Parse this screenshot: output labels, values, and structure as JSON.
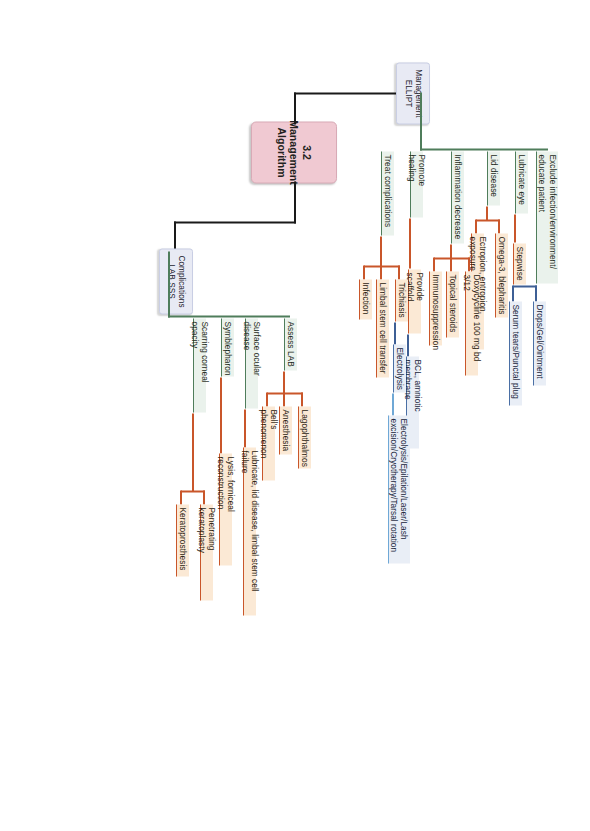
{
  "diagram": {
    "type": "mind-map",
    "orientation": "rotated-90-clockwise",
    "root": {
      "label": "3.2 Management\nAlgorithm",
      "color": "#f0c9d2"
    },
    "branches": [
      {
        "id": "management",
        "label": "Management\nELLIPT",
        "color": "#e8eaf4",
        "children": [
          {
            "label": "Exclude infection/environment/\neducate patient",
            "children": []
          },
          {
            "label": "Lubricate eye",
            "children": [
              {
                "label": "Stepwise",
                "children": [
                  {
                    "label": "Drops/Gel/Ointment"
                  },
                  {
                    "label": "Serum tears/Punctal plug"
                  }
                ]
              }
            ]
          },
          {
            "label": "Lid disease",
            "children": [
              {
                "label": "Omega-3, blepharitis",
                "children": []
              },
              {
                "label": "Ectropion, entropion, exposure",
                "children": []
              }
            ]
          },
          {
            "label": "Inflammation decrease",
            "children": [
              {
                "label": "Doxycycline 100 mg bd 3/12",
                "children": []
              },
              {
                "label": "Topical steroids",
                "children": []
              },
              {
                "label": "Immunosuppression",
                "children": []
              }
            ]
          },
          {
            "label": "Promote healing",
            "children": [
              {
                "label": "Provide scaffold",
                "children": [
                  {
                    "label": "BCL, amniotic membrane"
                  }
                ]
              }
            ]
          },
          {
            "label": "Treat complications",
            "children": [
              {
                "label": "Trichiasis",
                "children": [
                  {
                    "label": "Electrolysis"
                  },
                  {
                    "label": "Electrolysis/Epilation/Laser/Lash\nexcision/Cryotherapy/Tarsal rotation"
                  }
                ]
              },
              {
                "label": "Limbal stem cell transfer",
                "children": []
              },
              {
                "label": "Infection",
                "children": []
              }
            ]
          }
        ]
      },
      {
        "id": "complications",
        "label": "Complications\nLAB SSS",
        "color": "#e8eaf4",
        "children": [
          {
            "label": "Assess LAB",
            "children": [
              {
                "label": "Lagophthalmos"
              },
              {
                "label": "Anesthesia"
              },
              {
                "label": "Bell's phenomenon"
              }
            ]
          },
          {
            "label": "Surface ocular disease",
            "children": [
              {
                "label": "Lubricate, lid disease, limbal stem cell failure"
              }
            ]
          },
          {
            "label": "Symblepharon",
            "children": [
              {
                "label": "Lysis, forniceal reconstruction"
              }
            ]
          },
          {
            "label": "Scarring corneal opacity",
            "children": [
              {
                "label": "Penetrating keratoplasty"
              },
              {
                "label": "Keratoprosthesis"
              }
            ]
          }
        ]
      }
    ]
  },
  "labels": {
    "root": "3.2 Management\nAlgorithm",
    "b1": "Management\nELLIPT",
    "b2": "Complications\nLAB SSS",
    "m1": "Exclude infection/environment/\neducate patient",
    "m2": "Lubricate eye",
    "m3": "Lid disease",
    "m4": "Inflammation decrease",
    "m5": "Promote healing",
    "m6": "Treat complications",
    "m2a": "Stepwise",
    "m2a1": "Drops/Gel/Ointment",
    "m2a2": "Serum tears/Punctal plug",
    "m3a": "Omega-3, blepharitis",
    "m3b": "Ectropion, entropion, exposure",
    "m4a": "Doxycycline 100 mg bd 3/12",
    "m4b": "Topical steroids",
    "m4c": "Immunosuppression",
    "m5a": "Provide scaffold",
    "m5a1": "BCL, amniotic membrane",
    "m6a": "Trichiasis",
    "m6a1": "Electrolysis",
    "m6a2": "Electrolysis/Epilation/Laser/Lash\nexcision/Cryotherapy/Tarsal rotation",
    "m6b": "Limbal stem cell transfer",
    "m6c": "Infection",
    "c1": "Assess LAB",
    "c1a": "Lagophthalmos",
    "c1b": "Anesthesia",
    "c1c": "Bell's phenomenon",
    "c2": "Surface ocular disease",
    "c2a": "Lubricate, lid disease, limbal stem cell failure",
    "c3": "Symblepharon",
    "c3a": "Lysis, forniceal reconstruction",
    "c4": "Scarring corneal opacity",
    "c4a": "Penetrating keratoplasty",
    "c4b": "Keratoprosthesis"
  },
  "colors": {
    "root_fill": "#f0c9d2",
    "level1_fill": "#e8eaf4",
    "level2_line": "#4f7d5b",
    "level3_line": "#c9562a",
    "level4_line": "#3e5f95",
    "level4_line_light": "#6fa8d6",
    "trunk": "#000000"
  }
}
